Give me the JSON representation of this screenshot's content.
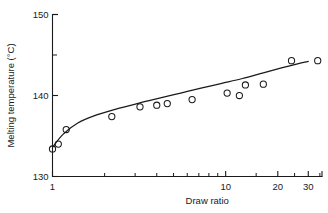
{
  "figure": {
    "background_color": "#ffffff",
    "ink_color": "#1a1a1a"
  },
  "chart_data": {
    "type": "scatter",
    "title": "",
    "xlabel": "Draw ratio",
    "ylabel": "Melting temperature  (°C)",
    "xscale": "log",
    "yscale": "linear",
    "xlim": [
      1,
      36
    ],
    "ylim": [
      130,
      150
    ],
    "grid": false,
    "legend": null,
    "x_ticks_major": [
      1,
      10,
      20,
      30
    ],
    "x_tick_labels": [
      "1",
      "10",
      "20",
      "30"
    ],
    "x_ticks_minor": [
      2,
      3,
      4,
      5,
      6,
      7,
      8,
      9,
      15,
      25,
      35
    ],
    "y_ticks_major": [
      130,
      140,
      150
    ],
    "y_tick_labels": [
      "130",
      "140",
      "150"
    ],
    "y_ticks_minor": [
      145
    ],
    "marker": "open-circle",
    "x": [
      1.0,
      1.08,
      1.2,
      2.2,
      3.2,
      4.0,
      4.6,
      6.4,
      10.2,
      12.0,
      13.0,
      16.5,
      24.0,
      34.0
    ],
    "y": [
      133.4,
      134.0,
      135.8,
      137.4,
      138.6,
      138.8,
      139.0,
      139.5,
      140.3,
      140.0,
      141.3,
      141.4,
      144.3,
      144.3
    ],
    "points": [
      {
        "x": 1.0,
        "y": 133.4
      },
      {
        "x": 1.08,
        "y": 134.0
      },
      {
        "x": 1.2,
        "y": 135.8
      },
      {
        "x": 2.2,
        "y": 137.4
      },
      {
        "x": 3.2,
        "y": 138.6
      },
      {
        "x": 4.0,
        "y": 138.8
      },
      {
        "x": 4.6,
        "y": 139.0
      },
      {
        "x": 6.4,
        "y": 139.5
      },
      {
        "x": 10.2,
        "y": 140.3
      },
      {
        "x": 12.0,
        "y": 140.0
      },
      {
        "x": 13.0,
        "y": 141.3
      },
      {
        "x": 16.5,
        "y": 141.4
      },
      {
        "x": 24.0,
        "y": 144.3
      },
      {
        "x": 34.0,
        "y": 144.3
      }
    ],
    "fit_curve": {
      "name": "fitted-trend-line",
      "x": [
        1.0,
        1.15,
        1.4,
        1.8,
        2.4,
        3.2,
        4.2,
        5.5,
        7.2,
        9.5,
        12.5,
        16.5,
        21.0,
        26.0,
        30.0
      ],
      "y": [
        133.6,
        135.2,
        136.6,
        137.6,
        138.4,
        139.1,
        139.7,
        140.3,
        140.9,
        141.5,
        142.1,
        142.8,
        143.4,
        143.9,
        144.2
      ]
    }
  }
}
